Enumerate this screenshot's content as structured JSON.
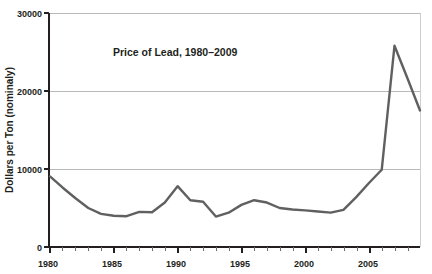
{
  "chart_data": {
    "type": "line",
    "title": "Price of Lead, 1980–2009",
    "xlabel": "",
    "ylabel": "Dollars per Ton (nominaly)",
    "xlim": [
      1980,
      2009
    ],
    "ylim": [
      0,
      30000
    ],
    "grid": true,
    "legend": "none",
    "x_major_ticks": [
      1980,
      1985,
      1990,
      1995,
      2000,
      2005
    ],
    "x_major_tick_labels": [
      "1980",
      "1985",
      "1990",
      "1995",
      "2000",
      "2005"
    ],
    "x_minor_tick_step": 1,
    "y_ticks": [
      0,
      10000,
      20000,
      30000
    ],
    "y_tick_labels": [
      "0",
      "10000",
      "20000",
      "30000"
    ],
    "series": [
      {
        "name": "Price of Lead",
        "color": "#606060",
        "x": [
          1980,
          1981,
          1982,
          1983,
          1984,
          1985,
          1986,
          1987,
          1988,
          1989,
          1990,
          1991,
          1992,
          1993,
          1994,
          1995,
          1996,
          1997,
          1998,
          1999,
          2000,
          2001,
          2002,
          2003,
          2004,
          2005,
          2006,
          2007,
          2008,
          2009
        ],
        "values": [
          9050,
          7600,
          6250,
          5000,
          4250,
          4000,
          3950,
          4500,
          4450,
          5700,
          7800,
          6000,
          5800,
          3900,
          4400,
          5400,
          6000,
          5700,
          5000,
          4800,
          4700,
          4550,
          4400,
          4750,
          6400,
          8200,
          9900,
          25800,
          21700,
          17500
        ]
      }
    ]
  }
}
